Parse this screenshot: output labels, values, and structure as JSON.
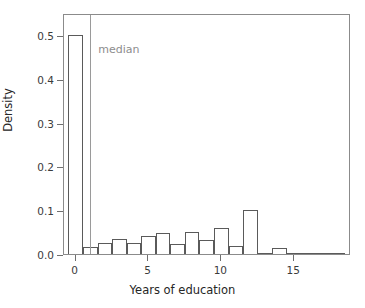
{
  "chart_data": {
    "type": "bar",
    "title": "",
    "subtitle": "",
    "xlabel": "Years of education",
    "ylabel": "Density",
    "xlim": [
      -0.8,
      18.9
    ],
    "ylim": [
      0.0,
      0.55
    ],
    "grid": false,
    "legend": false,
    "bar_width": 1,
    "categories": [
      0,
      1,
      2,
      3,
      4,
      5,
      6,
      7,
      8,
      9,
      10,
      11,
      12,
      13,
      14,
      15,
      16,
      17,
      18
    ],
    "values": [
      0.5,
      0.015,
      0.026,
      0.035,
      0.024,
      0.04,
      0.048,
      0.022,
      0.05,
      0.032,
      0.06,
      0.018,
      0.1,
      0.003,
      0.013,
      0.002,
      0.002,
      0.0,
      0.001
    ],
    "xticks": [
      0,
      5,
      10,
      15
    ],
    "xticklabels": [
      "0",
      "5",
      "10",
      "15"
    ],
    "yticks": [
      0.0,
      0.1,
      0.2,
      0.3,
      0.4,
      0.5
    ],
    "yticklabels": [
      "0.0",
      "0.1",
      "0.2",
      "0.3",
      "0.4",
      "0.5"
    ],
    "annotations": [
      {
        "name": "median",
        "label": "median",
        "type": "vline",
        "x": 1.0
      }
    ],
    "colors": {
      "bar_edge": "#5a5a5a",
      "bar_fill": "transparent",
      "frame": "#8b8b8b",
      "median_line": "#9a9a9a",
      "median_text": "#8d8d8d",
      "tick": "#6f6f6f",
      "text": "#3b3b3b"
    }
  }
}
